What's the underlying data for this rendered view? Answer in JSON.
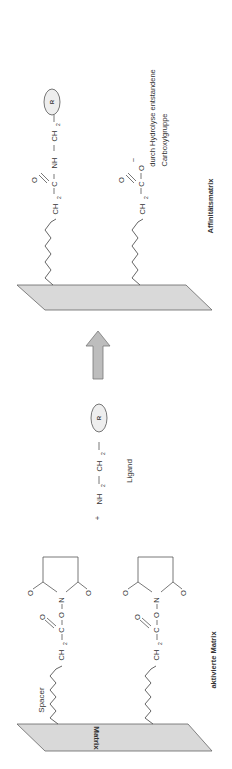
{
  "diagram": {
    "left": {
      "matrix_label": "Matrix",
      "spacer_label": "Spacer",
      "caption": "aktivierte Matrix",
      "ch2": "CH",
      "sub2": "2",
      "c": "C",
      "o": "O",
      "n": "N"
    },
    "middle": {
      "plus": "+",
      "nh2": "NH",
      "ch2": "CH",
      "sub2": "2",
      "r": "R",
      "ligand_label": "Ligand"
    },
    "right": {
      "caption": "Affinitätsmatrix",
      "nh": "NH",
      "ch2": "CH",
      "sub2": "2",
      "r": "R",
      "o": "O",
      "c": "C",
      "ominus": "O",
      "minus": "−",
      "hydrolysis_line1": "durch Hydrolyse entstandene",
      "hydrolysis_line2": "Carboxylgruppe"
    },
    "colors": {
      "plane": "#d9d9d9",
      "arrow": "#bdbdbd",
      "line": "#555555",
      "text": "#333333"
    }
  }
}
